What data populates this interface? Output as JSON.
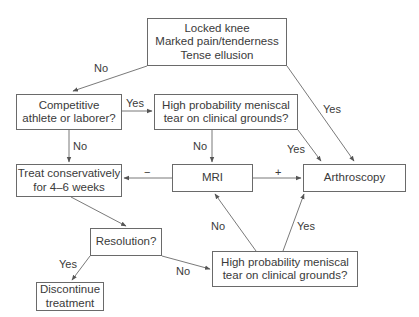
{
  "nodes": {
    "start": "Locked knee\nMarked pain/tenderness\nTense ellusion",
    "competitive": "Competitive\nathlete or laborer?",
    "highprob1": "High probability meniscal\ntear on clinical grounds?",
    "treat": "Treat conservatively\nfor 4–6 weeks",
    "mri": "MRI",
    "arthroscopy": "Arthroscopy",
    "resolution": "Resolution?",
    "discontinue": "Discontinue\ntreatment",
    "highprob2": "High probability meniscal\ntear on clinical grounds?"
  },
  "edge_labels": {
    "start_no": "No",
    "start_yes": "Yes",
    "competitive_yes": "Yes",
    "competitive_no": "No",
    "highprob1_no": "No",
    "highprob1_yes": "Yes",
    "mri_negative": "−",
    "mri_positive": "+",
    "resolution_yes": "Yes",
    "resolution_no": "No",
    "highprob2_no": "No",
    "highprob2_yes": "Yes"
  },
  "colors": {
    "line": "#6a6a6a",
    "text": "#3a3a3a"
  }
}
